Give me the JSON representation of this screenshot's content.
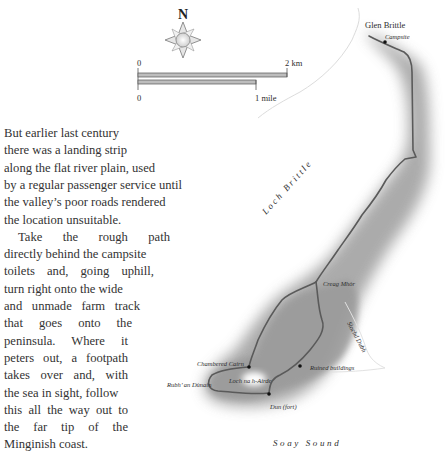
{
  "text": {
    "lines": [
      "But earlier last century",
      "there was a landing strip",
      "along the flat river plain, used",
      "by a regular passenger service until",
      "the valley’s poor roads rendered",
      "the location unsuitable.",
      "Take the rough path",
      "directly behind the campsite",
      "toilets and, going uphill,",
      "turn right onto the wide",
      "and unmade farm track",
      "that goes onto the",
      "peninsula. Where it",
      "peters out, a footpath",
      "takes over and, with",
      "the sea in sight, follow",
      "this all the way out to",
      "the far tip of the",
      "Minginish coast."
    ]
  },
  "map": {
    "compass": {
      "north_label": "N",
      "icon": "compass-rose-icon"
    },
    "scale_bar": {
      "km": {
        "start": "0",
        "end": "2 km"
      },
      "mile": {
        "start": "0",
        "end": "1 mile"
      }
    },
    "places": {
      "glen_brittle": "Glen Brittle",
      "campsite": "Campsite",
      "loch_brittle": "Loch Brittle",
      "creag_mhor": "Creag Mhòr",
      "slochd_dubh": "Slochd Dubh",
      "chambered_cairn": "Chambered Cairn",
      "rubh_an_dunain": "Rubh’ an Dùnain",
      "lochan_na_h_airde": "Loch na h-Airde",
      "ruined_buildings": "Ruined buildings",
      "dun_fort": "Dun (fort)",
      "soay_sound": "Soay Sound"
    },
    "colors": {
      "land_shade": "#8a8a8a",
      "path": "#555555",
      "coast": "#d8d8d8"
    }
  }
}
